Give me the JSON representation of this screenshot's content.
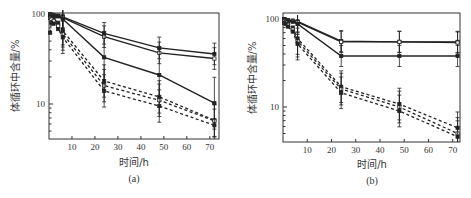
{
  "chart_data": [
    {
      "type": "line",
      "panel": "a",
      "caption": "(a)",
      "xlabel": "时间/h",
      "ylabel": "体循环中含量/%",
      "yscale": "log",
      "xlim": [
        0,
        74
      ],
      "ylim": [
        4.3,
        100
      ],
      "xticks": [
        10,
        20,
        30,
        40,
        50,
        60,
        70
      ],
      "yticks": [
        10,
        100
      ],
      "grid": false,
      "x": [
        0.5,
        1,
        2,
        4,
        6,
        24,
        48,
        72
      ],
      "series": [
        {
          "name": "solid-1",
          "style": "solid",
          "values": [
            100,
            98,
            97,
            96,
            93,
            61,
            42,
            36
          ]
        },
        {
          "name": "solid-2",
          "style": "solid",
          "values": [
            99,
            97,
            96,
            95,
            91,
            56,
            37,
            32
          ]
        },
        {
          "name": "solid-3",
          "style": "solid",
          "values": [
            98,
            96,
            95,
            94,
            88,
            33,
            21,
            10.2
          ]
        },
        {
          "name": "dashed-1",
          "style": "dashed",
          "values": [
            95,
            92,
            88,
            80,
            65,
            18,
            12,
            6.6
          ]
        },
        {
          "name": "dashed-2",
          "style": "dashed",
          "values": [
            90,
            88,
            84,
            74,
            60,
            16,
            11,
            6.5
          ]
        },
        {
          "name": "dashed-3",
          "style": "dashed",
          "values": [
            62,
            80,
            78,
            68,
            55,
            14,
            9.5,
            5.8
          ]
        }
      ]
    },
    {
      "type": "line",
      "panel": "b",
      "caption": "(b)",
      "xlabel": "时间/h",
      "ylabel": "体循环中含量/%",
      "yscale": "log",
      "xlim": [
        0,
        73
      ],
      "ylim": [
        4.2,
        100
      ],
      "xticks": [
        10,
        20,
        30,
        40,
        50,
        60,
        70
      ],
      "yticks": [
        10,
        100
      ],
      "grid": false,
      "x": [
        0.5,
        1,
        2,
        4,
        6,
        24,
        48,
        72
      ],
      "series": [
        {
          "name": "solid-1",
          "style": "solid",
          "values": [
            100,
            98,
            97,
            96,
            94,
            56,
            55,
            55
          ]
        },
        {
          "name": "solid-2",
          "style": "solid",
          "values": [
            99,
            97,
            96,
            95,
            92,
            55,
            55,
            54
          ]
        },
        {
          "name": "solid-3",
          "style": "solid",
          "values": [
            98,
            96,
            95,
            93,
            88,
            38,
            38,
            38
          ]
        },
        {
          "name": "dashed-1",
          "style": "dashed",
          "values": [
            100,
            95,
            90,
            80,
            60,
            17,
            10.8,
            5.8
          ]
        },
        {
          "name": "dashed-2",
          "style": "dashed",
          "values": [
            95,
            92,
            86,
            76,
            56,
            16,
            10,
            5.0
          ]
        },
        {
          "name": "dashed-3",
          "style": "dashed",
          "values": [
            90,
            88,
            82,
            72,
            52,
            14.5,
            9.0,
            4.6
          ]
        }
      ]
    }
  ],
  "labels": {
    "a": {
      "xlabel": "时间/h",
      "ylabel": "体循环中含量/%",
      "caption": "(a)",
      "ytick_100": "100",
      "ytick_10": "10",
      "xticks": [
        "10",
        "20",
        "30",
        "40",
        "50",
        "60",
        "70"
      ]
    },
    "b": {
      "xlabel": "时间/h",
      "ylabel": "体循环中含量/%",
      "caption": "(b)",
      "ytick_100": "100",
      "ytick_10": "10",
      "xticks": [
        "10",
        "20",
        "30",
        "40",
        "50",
        "60",
        "70"
      ]
    }
  },
  "colors": {
    "line": "#222222",
    "frame": "#333333",
    "background": "#ffffff"
  }
}
